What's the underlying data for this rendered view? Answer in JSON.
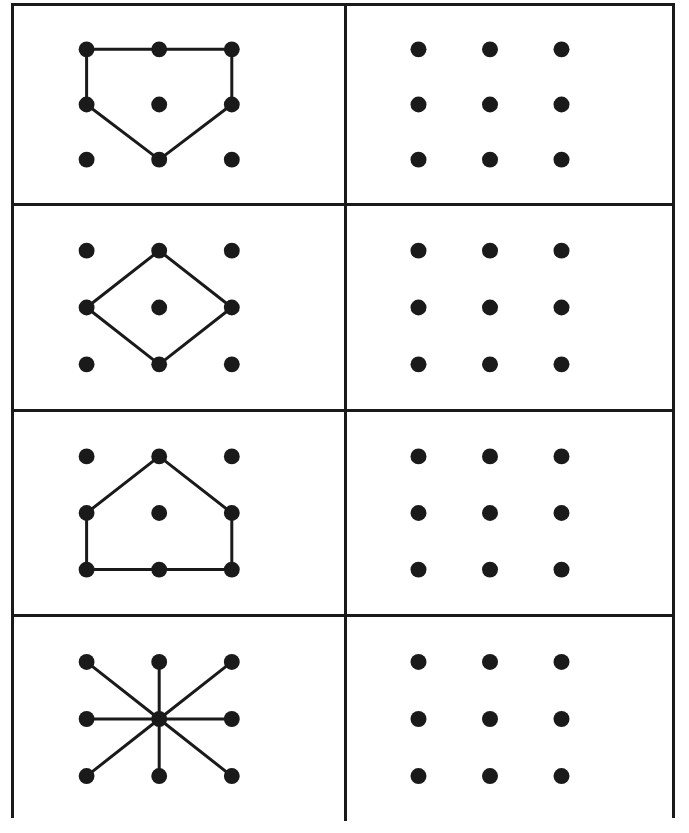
{
  "page": {
    "width": 689,
    "height": 833,
    "background_color": "#ffffff",
    "ink_color": "#1a1a1a"
  },
  "frame": {
    "x": 11,
    "y": 3,
    "width": 664,
    "height": 815,
    "border_width": 3,
    "border_color": "#1a1a1a"
  },
  "grid_layout": {
    "rows": 4,
    "columns": 2,
    "row_heights": [
      200,
      206,
      205,
      204
    ],
    "column_widths": [
      333,
      325
    ],
    "divider_color": "#1a1a1a",
    "divider_width": 3
  },
  "dot_grid": {
    "rows": 3,
    "columns": 3,
    "dot_radius": 8,
    "dot_color": "#1a1a1a",
    "line_color": "#1a1a1a",
    "line_width": 3,
    "node_labels": [
      "top-left",
      "top-center",
      "top-right",
      "mid-left",
      "center",
      "mid-right",
      "bottom-left",
      "bottom-center",
      "bottom-right"
    ],
    "node_positions_pct": {
      "x": [
        22,
        44,
        66
      ],
      "y": [
        22,
        50,
        78
      ]
    }
  },
  "cells": [
    {
      "row": 1,
      "column": "left",
      "name": "pentagon-home-plate-inverted",
      "kind": "pattern",
      "shape_type": "closed-polygon",
      "path_nodes": [
        "top-left",
        "top-center",
        "top-right",
        "mid-right",
        "bottom-center",
        "mid-left",
        "top-left"
      ],
      "edges": [
        [
          "top-left",
          "top-center"
        ],
        [
          "top-center",
          "top-right"
        ],
        [
          "top-right",
          "mid-right"
        ],
        [
          "mid-right",
          "bottom-center"
        ],
        [
          "bottom-center",
          "mid-left"
        ],
        [
          "mid-left",
          "top-left"
        ]
      ]
    },
    {
      "row": 1,
      "column": "right",
      "name": "blank-dot-grid",
      "kind": "blank",
      "shape_type": "none",
      "edges": []
    },
    {
      "row": 2,
      "column": "left",
      "name": "diamond-rhombus",
      "kind": "pattern",
      "shape_type": "closed-polygon",
      "path_nodes": [
        "top-center",
        "mid-right",
        "bottom-center",
        "mid-left",
        "top-center"
      ],
      "edges": [
        [
          "top-center",
          "mid-right"
        ],
        [
          "mid-right",
          "bottom-center"
        ],
        [
          "bottom-center",
          "mid-left"
        ],
        [
          "mid-left",
          "top-center"
        ]
      ]
    },
    {
      "row": 2,
      "column": "right",
      "name": "blank-dot-grid",
      "kind": "blank",
      "shape_type": "none",
      "edges": []
    },
    {
      "row": 3,
      "column": "left",
      "name": "house-pentagon",
      "kind": "pattern",
      "shape_type": "closed-polygon",
      "path_nodes": [
        "top-center",
        "mid-right",
        "bottom-right",
        "bottom-center",
        "bottom-left",
        "mid-left",
        "top-center"
      ],
      "edges": [
        [
          "top-center",
          "mid-right"
        ],
        [
          "mid-right",
          "bottom-right"
        ],
        [
          "bottom-right",
          "bottom-center"
        ],
        [
          "bottom-center",
          "bottom-left"
        ],
        [
          "bottom-left",
          "mid-left"
        ],
        [
          "mid-left",
          "top-center"
        ]
      ]
    },
    {
      "row": 3,
      "column": "right",
      "name": "blank-dot-grid",
      "kind": "blank",
      "shape_type": "none",
      "edges": []
    },
    {
      "row": 4,
      "column": "left",
      "name": "eight-spoke-star-asterisk",
      "kind": "pattern",
      "shape_type": "radial-spokes",
      "path_nodes": [
        "center"
      ],
      "edges": [
        [
          "center",
          "top-left"
        ],
        [
          "center",
          "top-center"
        ],
        [
          "center",
          "top-right"
        ],
        [
          "center",
          "mid-left"
        ],
        [
          "center",
          "mid-right"
        ],
        [
          "center",
          "bottom-left"
        ],
        [
          "center",
          "bottom-center"
        ],
        [
          "center",
          "bottom-right"
        ]
      ]
    },
    {
      "row": 4,
      "column": "right",
      "name": "blank-dot-grid",
      "kind": "blank",
      "shape_type": "none",
      "edges": []
    }
  ]
}
